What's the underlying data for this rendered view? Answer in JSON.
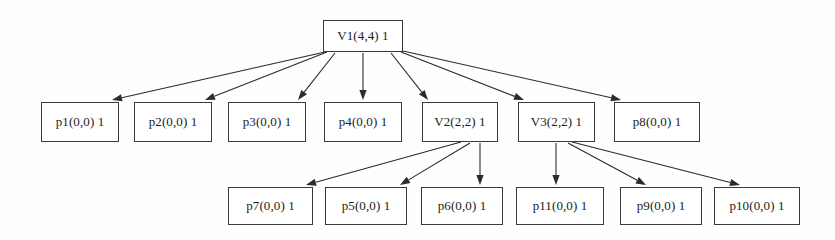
{
  "diagram": {
    "type": "tree",
    "background_color": "#fefefe",
    "node_fill": "#ffffff",
    "node_border_color": "#3a3a3a",
    "edge_color": "#2b2b2b",
    "text_color": "#1c1c1c",
    "nodes": [
      {
        "id": "V1",
        "label": "V1(4,4) 1",
        "x": 323,
        "y": 20,
        "w": 80,
        "h": 32,
        "level": 0
      },
      {
        "id": "p1",
        "label": "p1(0,0) 1",
        "x": 41,
        "y": 102,
        "w": 78,
        "h": 40,
        "level": 1
      },
      {
        "id": "p2",
        "label": "p2(0,0) 1",
        "x": 134,
        "y": 102,
        "w": 78,
        "h": 40,
        "level": 1
      },
      {
        "id": "p3",
        "label": "p3(0,0) 1",
        "x": 228,
        "y": 102,
        "w": 78,
        "h": 40,
        "level": 1
      },
      {
        "id": "p4",
        "label": "p4(0,0) 1",
        "x": 324,
        "y": 102,
        "w": 78,
        "h": 40,
        "level": 1
      },
      {
        "id": "V2",
        "label": "V2(2,2) 1",
        "x": 422,
        "y": 102,
        "w": 76,
        "h": 40,
        "level": 1
      },
      {
        "id": "V3",
        "label": "V3(2,2) 1",
        "x": 518,
        "y": 102,
        "w": 77,
        "h": 40,
        "level": 1
      },
      {
        "id": "p8",
        "label": "p8(0,0) 1",
        "x": 614,
        "y": 102,
        "w": 86,
        "h": 40,
        "level": 1
      },
      {
        "id": "p7",
        "label": "p7(0,0) 1",
        "x": 228,
        "y": 187,
        "w": 85,
        "h": 38,
        "level": 2
      },
      {
        "id": "p5",
        "label": "p5(0,0) 1",
        "x": 325,
        "y": 187,
        "w": 82,
        "h": 38,
        "level": 2
      },
      {
        "id": "p6",
        "label": "p6(0,0) 1",
        "x": 421,
        "y": 187,
        "w": 82,
        "h": 38,
        "level": 2
      },
      {
        "id": "p11",
        "label": "p11(0,0) 1",
        "x": 516,
        "y": 187,
        "w": 88,
        "h": 38,
        "level": 2
      },
      {
        "id": "p9",
        "label": "p9(0,0) 1",
        "x": 620,
        "y": 187,
        "w": 82,
        "h": 38,
        "level": 2
      },
      {
        "id": "p10",
        "label": "p10(0,0) 1",
        "x": 714,
        "y": 187,
        "w": 86,
        "h": 38,
        "level": 2
      }
    ],
    "edges": [
      {
        "from": "V1",
        "to": "p1",
        "x1": 325,
        "y1": 52,
        "x2": 112,
        "y2": 100
      },
      {
        "from": "V1",
        "to": "p2",
        "x1": 327,
        "y1": 52,
        "x2": 205,
        "y2": 100
      },
      {
        "from": "V1",
        "to": "p3",
        "x1": 335,
        "y1": 53,
        "x2": 298,
        "y2": 100
      },
      {
        "from": "V1",
        "to": "p4",
        "x1": 363,
        "y1": 53,
        "x2": 363,
        "y2": 100
      },
      {
        "from": "V1",
        "to": "V2",
        "x1": 391,
        "y1": 53,
        "x2": 428,
        "y2": 100
      },
      {
        "from": "V1",
        "to": "V3",
        "x1": 401,
        "y1": 52,
        "x2": 524,
        "y2": 100
      },
      {
        "from": "V1",
        "to": "p8",
        "x1": 403,
        "y1": 51,
        "x2": 621,
        "y2": 100
      },
      {
        "from": "V2",
        "to": "p7",
        "x1": 461,
        "y1": 142,
        "x2": 306,
        "y2": 185
      },
      {
        "from": "V2",
        "to": "p5",
        "x1": 470,
        "y1": 143,
        "x2": 400,
        "y2": 185
      },
      {
        "from": "V2",
        "to": "p6",
        "x1": 480,
        "y1": 143,
        "x2": 480,
        "y2": 185
      },
      {
        "from": "V3",
        "to": "p11",
        "x1": 556,
        "y1": 143,
        "x2": 556,
        "y2": 185
      },
      {
        "from": "V3",
        "to": "p9",
        "x1": 568,
        "y1": 143,
        "x2": 646,
        "y2": 185
      },
      {
        "from": "V3",
        "to": "p10",
        "x1": 572,
        "y1": 142,
        "x2": 740,
        "y2": 185
      }
    ]
  }
}
